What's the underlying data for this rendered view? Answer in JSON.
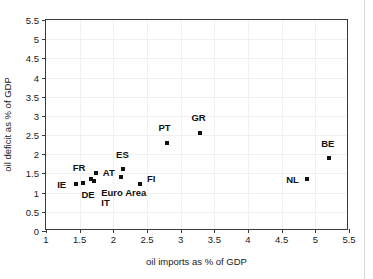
{
  "chart_data": {
    "type": "scatter",
    "title": "",
    "xlabel": "oil imports as % of GDP",
    "ylabel": "oil deficit as % of GDP",
    "xlim": [
      1,
      5.5
    ],
    "ylim": [
      0,
      5.5
    ],
    "xticks": [
      "1",
      "1.5",
      "2",
      "2.5",
      "3",
      "3.5",
      "4",
      "4.5",
      "5",
      "5.5"
    ],
    "xtick_values": [
      1,
      1.5,
      2,
      2.5,
      3,
      3.5,
      4,
      4.5,
      5,
      5.5
    ],
    "yticks": [
      "0",
      "0.5",
      "1",
      "1.5",
      "2",
      "2.5",
      "3",
      "3.5",
      "4",
      "4.5",
      "5",
      "5.5"
    ],
    "ytick_values": [
      0,
      0.5,
      1,
      1.5,
      2,
      2.5,
      3,
      3.5,
      4,
      4.5,
      5,
      5.5
    ],
    "grid": true,
    "legend": false,
    "marker_color": "#111111",
    "points": [
      {
        "label": "IE",
        "x": 1.44,
        "y": 1.22,
        "label_dx": -14,
        "label_dy": 0
      },
      {
        "label": "FR",
        "x": 1.55,
        "y": 1.25,
        "label_dx": -4,
        "label_dy": -16
      },
      {
        "label": "DE",
        "x": 1.67,
        "y": 1.36,
        "label_dx": -3,
        "label_dy": 15
      },
      {
        "label": "AT",
        "x": 1.74,
        "y": 1.52,
        "label_dx": 13,
        "label_dy": -1
      },
      {
        "label": "IT",
        "x": 1.72,
        "y": 1.3,
        "label_dx": 11,
        "label_dy": 21
      },
      {
        "label": "ES",
        "x": 2.15,
        "y": 1.61,
        "label_dx": -1,
        "label_dy": -15
      },
      {
        "label": "Euro Area",
        "x": 2.11,
        "y": 1.41,
        "label_dx": 3,
        "label_dy": 15
      },
      {
        "label": "FI",
        "x": 2.4,
        "y": 1.23,
        "label_dx": 11,
        "label_dy": -6
      },
      {
        "label": "PT",
        "x": 2.79,
        "y": 2.29,
        "label_dx": -2,
        "label_dy": -16
      },
      {
        "label": "GR",
        "x": 3.28,
        "y": 2.56,
        "label_dx": -1,
        "label_dy": -16
      },
      {
        "label": "NL",
        "x": 4.87,
        "y": 1.36,
        "label_dx": -14,
        "label_dy": 0
      },
      {
        "label": "BE",
        "x": 5.2,
        "y": 1.9,
        "label_dx": -1,
        "label_dy": -15
      }
    ]
  }
}
